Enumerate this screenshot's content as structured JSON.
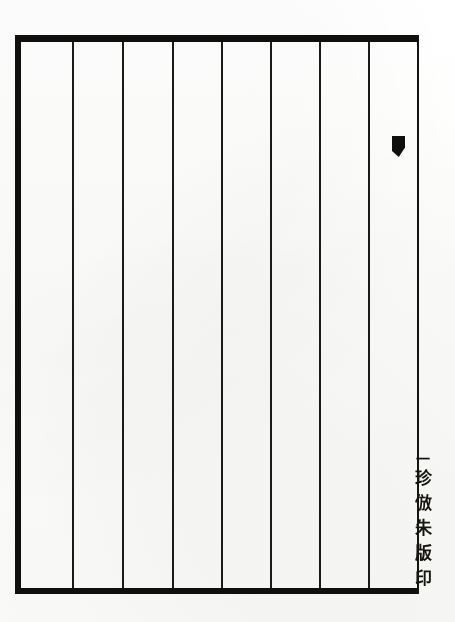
{
  "page": {
    "kind": "scanned-chinese-woodblock-page",
    "background_color": "#fdfdfc",
    "ink_color": "#100f0d",
    "width": 455,
    "height": 622
  },
  "frame": {
    "label": "banfu-frame",
    "left": 15,
    "top": 35,
    "width": 404,
    "height": 559,
    "top_rule_thickness": 7,
    "bottom_rule_thickness": 6,
    "left_rule_thickness": 6,
    "right_rule_thickness": 2
  },
  "columns": {
    "label": "ruled-column-lines",
    "count": 8,
    "x_positions": [
      72,
      122,
      172,
      221,
      270,
      319,
      368
    ],
    "spacing": 50,
    "line_color": "#1b1a16",
    "line_width": 1.6,
    "text": [
      "",
      "",
      "",
      "",
      "",
      "",
      "",
      "",
      ""
    ]
  },
  "marks": {
    "ink_wedge": {
      "label": "ink-wedge-mark",
      "x": 392,
      "y": 136,
      "width": 13,
      "height": 21
    }
  },
  "colophon": {
    "label": "vertical-colophon",
    "orientation": "vertical-top-to-bottom",
    "tick": "一",
    "characters": [
      "珍",
      "倣",
      "朱",
      "版",
      "印"
    ],
    "reading": "珍倣朱版印",
    "x": 408,
    "y": 452
  }
}
